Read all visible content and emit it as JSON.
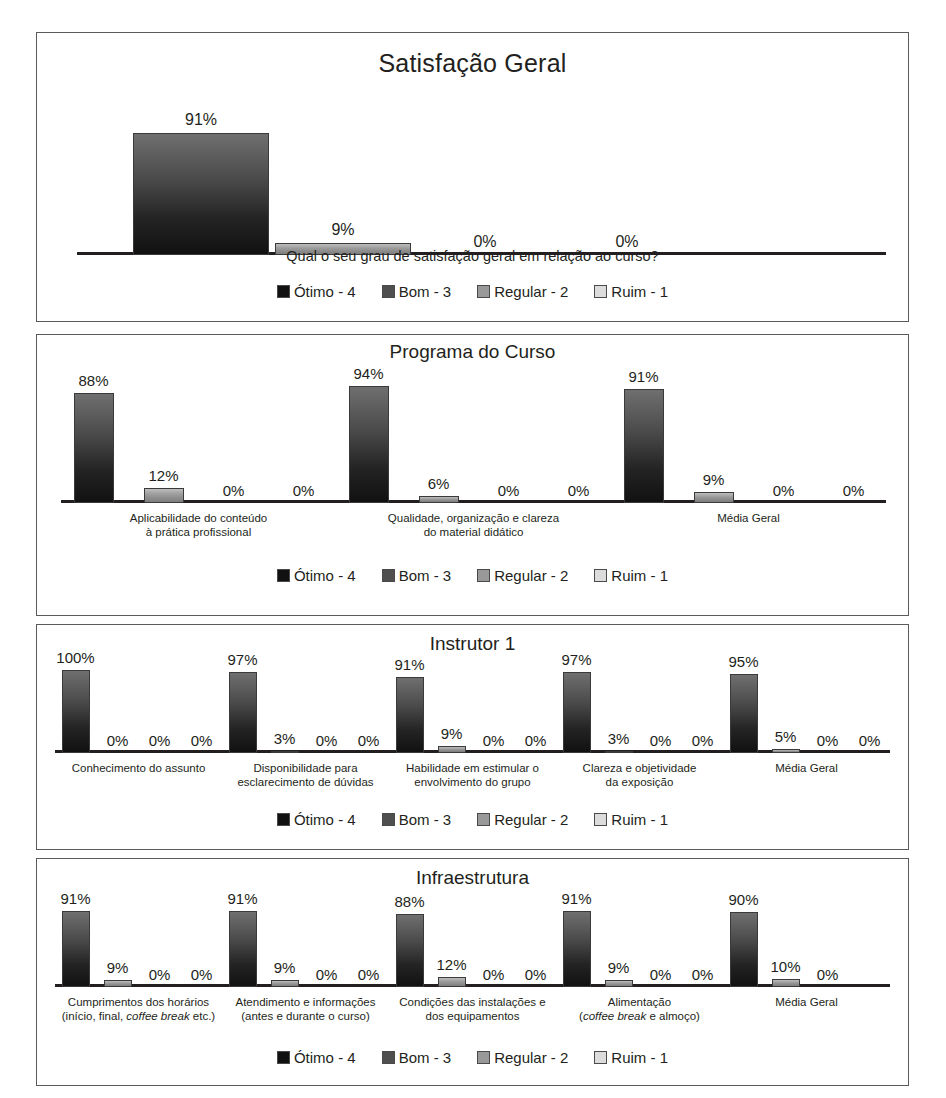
{
  "legend": {
    "items": [
      {
        "label": "Ótimo - 4",
        "swatch": "#111111"
      },
      {
        "label": "Bom - 3",
        "swatch": "#4f4f4f"
      },
      {
        "label": "Regular - 2",
        "swatch": "#999999"
      },
      {
        "label": "Ruim - 1",
        "swatch": "#dcdcdc"
      }
    ]
  },
  "chart_data": [
    {
      "type": "bar",
      "title": "Satisfação Geral",
      "caption": "Qual o seu grau de satisfação geral em relação ao curso?",
      "xlabel": "",
      "ylabel": "",
      "ylim": [
        0,
        100
      ],
      "grid": false,
      "legend_position": "bottom",
      "categories": [
        ""
      ],
      "series": [
        {
          "name": "Ótimo - 4",
          "values": [
            91
          ]
        },
        {
          "name": "Bom - 3",
          "values": [
            9
          ]
        },
        {
          "name": "Regular - 2",
          "values": [
            0
          ]
        },
        {
          "name": "Ruim - 1",
          "values": [
            0
          ]
        }
      ],
      "data_labels": [
        [
          "91%",
          "9%",
          "0%",
          "0%"
        ]
      ]
    },
    {
      "type": "bar",
      "title": "Programa do Curso",
      "caption": "",
      "xlabel": "",
      "ylabel": "",
      "ylim": [
        0,
        100
      ],
      "grid": false,
      "legend_position": "bottom",
      "categories": [
        "Aplicabilidade do conteúdo<br>à prática profissional",
        "Qualidade, organização e clareza<br>do material didático",
        "Média Geral"
      ],
      "series": [
        {
          "name": "Ótimo - 4",
          "values": [
            88,
            94,
            91
          ]
        },
        {
          "name": "Bom - 3",
          "values": [
            12,
            6,
            9
          ]
        },
        {
          "name": "Regular - 2",
          "values": [
            0,
            0,
            0
          ]
        },
        {
          "name": "Ruim - 1",
          "values": [
            0,
            0,
            0
          ]
        }
      ],
      "data_labels": [
        [
          "88%",
          "12%",
          "0%",
          "0%"
        ],
        [
          "94%",
          "6%",
          "0%",
          "0%"
        ],
        [
          "91%",
          "9%",
          "0%",
          "0%"
        ]
      ]
    },
    {
      "type": "bar",
      "title": "Instrutor 1",
      "caption": "",
      "xlabel": "",
      "ylabel": "",
      "ylim": [
        0,
        100
      ],
      "grid": false,
      "legend_position": "bottom",
      "categories": [
        "Conhecimento do assunto",
        "Disponibilidade para<br>esclarecimento de dúvidas",
        "Habilidade em estimular o<br>envolvimento do grupo",
        "Clareza e objetividade<br>da exposição",
        "Média Geral"
      ],
      "series": [
        {
          "name": "Ótimo - 4",
          "values": [
            100,
            97,
            91,
            97,
            95
          ]
        },
        {
          "name": "Bom - 3",
          "values": [
            0,
            3,
            9,
            3,
            5
          ]
        },
        {
          "name": "Regular - 2",
          "values": [
            0,
            0,
            0,
            0,
            0
          ]
        },
        {
          "name": "Ruim - 1",
          "values": [
            0,
            0,
            0,
            0,
            0
          ]
        }
      ],
      "data_labels": [
        [
          "100%",
          "0%",
          "0%",
          "0%"
        ],
        [
          "97%",
          "3%",
          "0%",
          "0%"
        ],
        [
          "91%",
          "9%",
          "0%",
          "0%"
        ],
        [
          "97%",
          "3%",
          "0%",
          "0%"
        ],
        [
          "95%",
          "5%",
          "0%",
          "0%"
        ]
      ]
    },
    {
      "type": "bar",
      "title": "Infraestrutura",
      "caption": "",
      "xlabel": "",
      "ylabel": "",
      "ylim": [
        0,
        100
      ],
      "grid": false,
      "legend_position": "bottom",
      "categories": [
        "Cumprimentos dos horários<br>(início, final, <i>coffee break</i> etc.)",
        "Atendimento e informações<br>(antes e durante o curso)",
        "Condições das instalações e<br>dos equipamentos",
        "Alimentação<br>(<i>coffee break</i> e almoço)",
        "Média Geral"
      ],
      "series": [
        {
          "name": "Ótimo - 4",
          "values": [
            91,
            91,
            88,
            91,
            90
          ]
        },
        {
          "name": "Bom - 3",
          "values": [
            9,
            9,
            12,
            9,
            10
          ]
        },
        {
          "name": "Regular - 2",
          "values": [
            0,
            0,
            0,
            0,
            0
          ]
        },
        {
          "name": "Ruim - 1",
          "values": [
            0,
            0,
            0,
            0,
            0
          ]
        }
      ],
      "data_labels": [
        [
          "91%",
          "9%",
          "0%",
          "0%"
        ],
        [
          "91%",
          "9%",
          "0%",
          "0%"
        ],
        [
          "88%",
          "12%",
          "0%",
          "0%"
        ],
        [
          "91%",
          "9%",
          "0%",
          "0%"
        ],
        [
          "90%",
          "10%",
          "0%",
          ""
        ]
      ]
    }
  ]
}
